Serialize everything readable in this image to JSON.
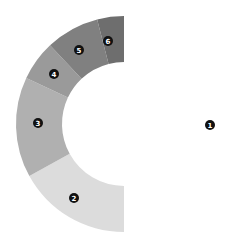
{
  "chart_data": {
    "type": "pie",
    "subtype": "donut",
    "title": "",
    "categories": [
      "1",
      "2",
      "3",
      "4",
      "5",
      "6"
    ],
    "values": [
      50,
      17,
      15,
      6,
      8,
      4
    ],
    "colors": [
      "#ffffff",
      "#dcdcdc",
      "#b0b0b0",
      "#9a9a9a",
      "#808080",
      "#6e6e6e"
    ],
    "start_angle_deg": 270,
    "direction": "clockwise-from-bottom-through-left",
    "legend": "none",
    "labels": "numbered circular markers"
  },
  "geometry": {
    "cx": 124,
    "cy": 124,
    "outer_r": 108,
    "inner_r": 62
  },
  "markers": [
    {
      "label": "1",
      "x": 210,
      "y": 125
    },
    {
      "label": "2",
      "x": 74,
      "y": 198
    },
    {
      "label": "3",
      "x": 38,
      "y": 123
    },
    {
      "label": "4",
      "x": 54,
      "y": 74
    },
    {
      "label": "5",
      "x": 79,
      "y": 50
    },
    {
      "label": "6",
      "x": 108,
      "y": 41
    }
  ]
}
